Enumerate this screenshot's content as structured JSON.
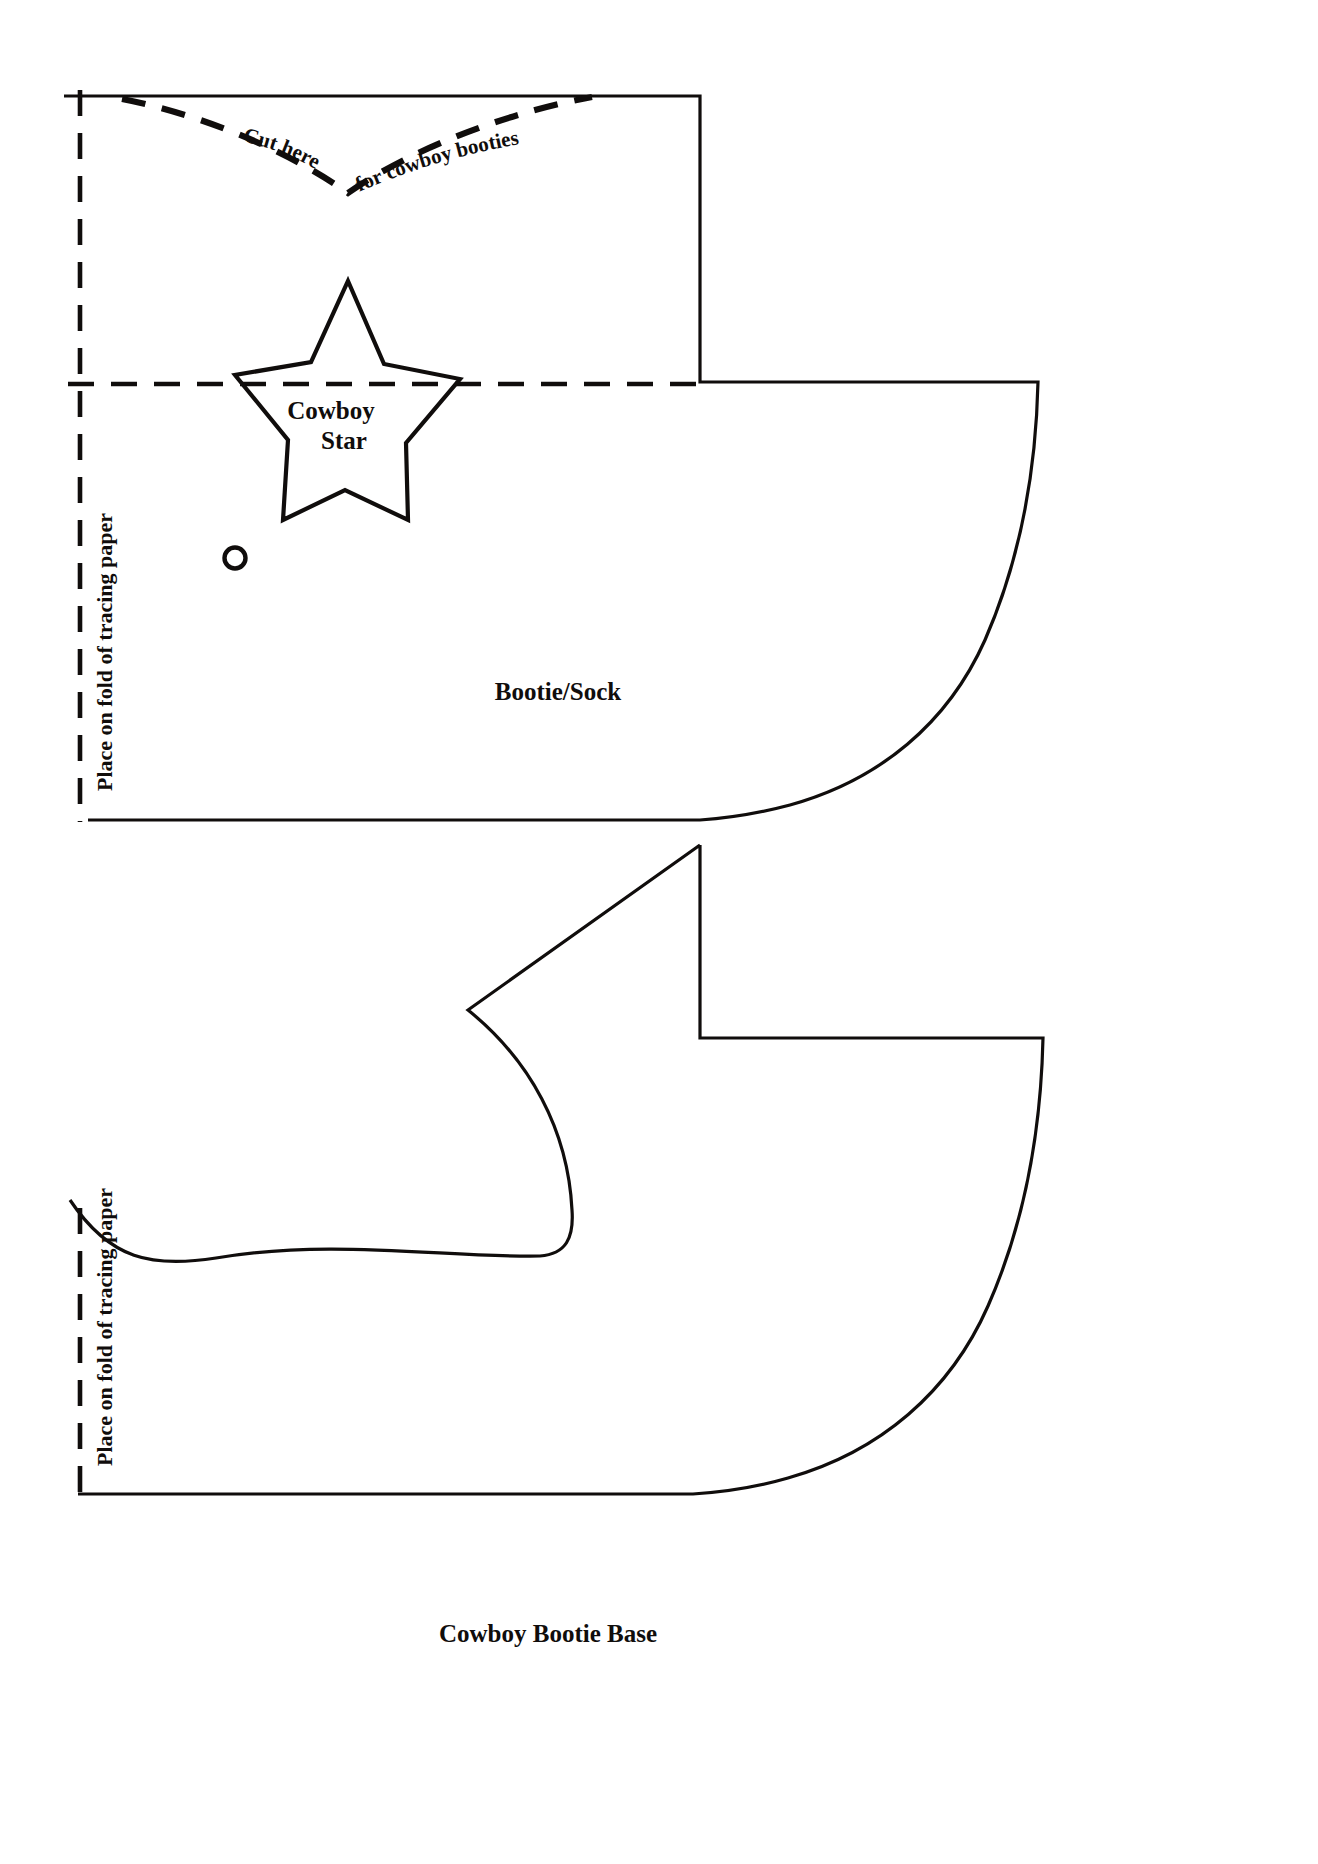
{
  "document": {
    "type": "sewing-pattern-template",
    "background_color": "#ffffff",
    "line_color": "#100d0c"
  },
  "patterns": [
    {
      "id": "bootie-sock",
      "label": "Bootie/Sock",
      "fold_label": "Place on fold of tracing paper",
      "cut_label_left": "Cut here",
      "cut_label_right": "for cowboy booties",
      "applique": {
        "label_line1": "Cowboy",
        "label_line2": "Star",
        "full_label": "Cowboy Star"
      },
      "marker": "placement-dot"
    },
    {
      "id": "cowboy-bootie-base",
      "label": "Cowboy Bootie Base",
      "fold_label": "Place on fold of tracing paper"
    }
  ],
  "labels": {
    "bootie_sock": "Bootie/Sock",
    "cowboy_star_line1": "Cowboy",
    "cowboy_star_line2": "Star",
    "cut_here": "Cut here",
    "for_cowboy_booties": "for cowboy booties",
    "place_on_fold_top": "Place on fold of tracing paper",
    "place_on_fold_bottom": "Place on fold of tracing paper",
    "cowboy_bootie_base": "Cowboy Bootie Base"
  }
}
